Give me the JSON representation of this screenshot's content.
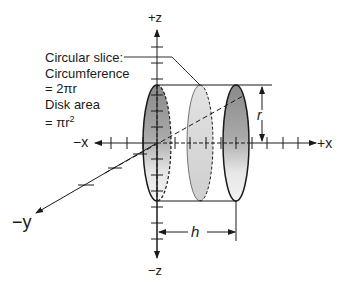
{
  "axes": {
    "pos_z": "+z",
    "neg_z": "−z",
    "pos_x": "+x",
    "neg_x": "−x",
    "neg_y": "−y"
  },
  "callout": {
    "line1": "Circular slice:",
    "line2": "Circumference",
    "line3": "= 2πr",
    "line4": "Disk area",
    "line5_prefix": "= πr",
    "line5_sup": "2"
  },
  "dimensions": {
    "radius": "r",
    "height": "h"
  },
  "colors": {
    "line": "#1a1a1a",
    "disk_dark": "#7a7a7a",
    "disk_light": "#d6d6d6",
    "background": "#ffffff"
  }
}
